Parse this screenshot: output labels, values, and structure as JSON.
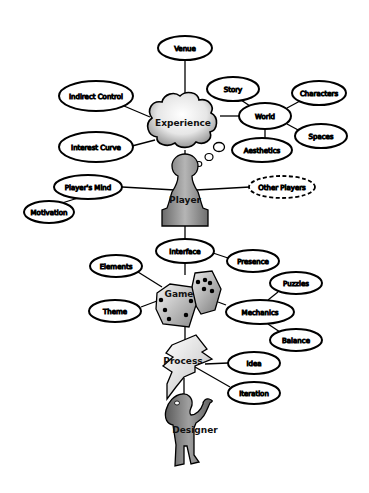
{
  "diagram": {
    "type": "concept-map",
    "colors": {
      "background": "#ffffff",
      "stroke": "#000000",
      "hub_fill_light": "#f2f2f2",
      "hub_fill_dark": "#8a8a8a",
      "figure_fill": "#7a7a7a"
    },
    "hubs": {
      "experience": {
        "label": "Experience",
        "shape": "cloud"
      },
      "player": {
        "label": "Player",
        "shape": "pawn"
      },
      "game": {
        "label": "Game",
        "shape": "dice"
      },
      "process": {
        "label": "Process",
        "shape": "lightning"
      },
      "designer": {
        "label": "Designer",
        "shape": "person"
      }
    },
    "nodes": {
      "venue": {
        "label": "Venue"
      },
      "indirect_control": {
        "label": "Indirect Control"
      },
      "interest_curve": {
        "label": "Interest Curve"
      },
      "story": {
        "label": "Story"
      },
      "world": {
        "label": "World"
      },
      "characters": {
        "label": "Characters"
      },
      "spaces": {
        "label": "Spaces"
      },
      "aesthetics": {
        "label": "Aesthetics"
      },
      "players_mind": {
        "label": "Player's Mind"
      },
      "motivation": {
        "label": "Motivation"
      },
      "other_players": {
        "label": "Other Players",
        "style": "dashed"
      },
      "interface": {
        "label": "Interface"
      },
      "presence": {
        "label": "Presence"
      },
      "elements": {
        "label": "Elements"
      },
      "theme": {
        "label": "Theme"
      },
      "mechanics": {
        "label": "Mechanics"
      },
      "puzzles": {
        "label": "Puzzles"
      },
      "balance": {
        "label": "Balance"
      },
      "idea": {
        "label": "Idea"
      },
      "iteration": {
        "label": "Iteration"
      }
    },
    "edges": [
      [
        "Venue",
        "Experience"
      ],
      [
        "Indirect Control",
        "Experience"
      ],
      [
        "Interest Curve",
        "Experience"
      ],
      [
        "World",
        "Experience"
      ],
      [
        "Story",
        "World"
      ],
      [
        "Characters",
        "World"
      ],
      [
        "Spaces",
        "World"
      ],
      [
        "Aesthetics",
        "World"
      ],
      [
        "Experience",
        "Player"
      ],
      [
        "Player's Mind",
        "Player"
      ],
      [
        "Motivation",
        "Player's Mind"
      ],
      [
        "Other Players",
        "Player"
      ],
      [
        "Player",
        "Interface"
      ],
      [
        "Presence",
        "Interface"
      ],
      [
        "Interface",
        "Game"
      ],
      [
        "Elements",
        "Game"
      ],
      [
        "Theme",
        "Game"
      ],
      [
        "Mechanics",
        "Game"
      ],
      [
        "Puzzles",
        "Mechanics"
      ],
      [
        "Balance",
        "Mechanics"
      ],
      [
        "Game",
        "Process"
      ],
      [
        "Idea",
        "Process"
      ],
      [
        "Iteration",
        "Process"
      ],
      [
        "Process",
        "Designer"
      ]
    ]
  }
}
